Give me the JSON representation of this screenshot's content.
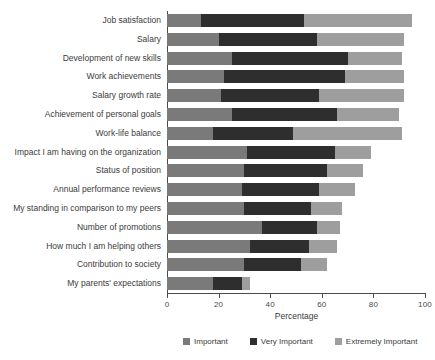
{
  "chart_data": {
    "type": "bar",
    "orientation": "horizontal",
    "stacked": true,
    "title": "",
    "xlabel": "Percentage",
    "ylabel": "",
    "xlim": [
      0,
      100
    ],
    "xticks": [
      0,
      20,
      40,
      60,
      80,
      100
    ],
    "xticklabels": [
      "0",
      "20",
      "40",
      "60",
      "80",
      "100"
    ],
    "grid": false,
    "legend_position": "bottom",
    "categories": [
      "Job satisfaction",
      "Salary",
      "Development of new skills",
      "Work achievements",
      "Salary growth rate",
      "Achievement of personal goals",
      "Work-life balance",
      "Impact I am having on the organization",
      "Status of position",
      "Annual performance reviews",
      "My standing in comparison to my peers",
      "Number of promotions",
      "How much I am helping others",
      "Contribution to society",
      "My parents' expectations"
    ],
    "series": [
      {
        "name": "Important",
        "color": "#7a7a7a",
        "values": [
          13,
          20,
          25,
          22,
          21,
          25,
          18,
          31,
          30,
          29,
          30,
          37,
          32,
          30,
          18
        ]
      },
      {
        "name": "Very Important",
        "color": "#2e2e2e",
        "values": [
          40,
          38,
          45,
          47,
          38,
          41,
          31,
          34,
          32,
          30,
          26,
          21,
          23,
          22,
          11
        ]
      },
      {
        "name": "Extremely Important",
        "color": "#9e9e9e",
        "values": [
          42,
          34,
          21,
          23,
          33,
          24,
          42,
          14,
          14,
          14,
          12,
          9,
          11,
          10,
          3
        ]
      }
    ],
    "totals": [
      95,
      92,
      91,
      92,
      92,
      90,
      91,
      79,
      76,
      73,
      68,
      67,
      66,
      62,
      32
    ]
  },
  "legend": {
    "items": [
      {
        "label": "Important",
        "color": "#7a7a7a"
      },
      {
        "label": "Very Important",
        "color": "#2e2e2e"
      },
      {
        "label": "Extremely Important",
        "color": "#9e9e9e"
      }
    ]
  },
  "axis": {
    "x_title": "Percentage"
  }
}
